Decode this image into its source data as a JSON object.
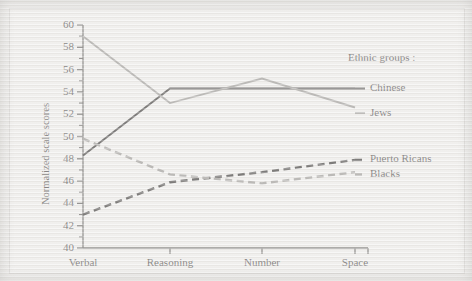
{
  "chart_data": {
    "type": "line",
    "title": "",
    "xlabel": "",
    "ylabel": "Normalized scale scores",
    "categories": [
      "Verbal",
      "Reasoning",
      "Number",
      "Space"
    ],
    "ylim": [
      40,
      60
    ],
    "yticks": [
      40,
      42,
      44,
      46,
      48,
      50,
      52,
      54,
      56,
      58,
      60
    ],
    "ytick_labels": [
      "40",
      "42",
      "44",
      "46",
      "48",
      "50",
      "52",
      "54",
      "56",
      "58",
      "60"
    ],
    "minor_tick_step": 1,
    "grid": false,
    "legend_title": "Ethnic groups :",
    "legend_position": "right",
    "series": [
      {
        "name": "Chinese",
        "values": [
          48.3,
          54.3,
          54.3,
          54.3
        ],
        "color": "#1d1b1a",
        "style": "solid",
        "label_y": 54.3
      },
      {
        "name": "Jews",
        "values": [
          59.0,
          53.0,
          55.2,
          52.6
        ],
        "color": "#8d8b88",
        "style": "solid",
        "label_y": 52.1
      },
      {
        "name": "Puerto Ricans",
        "values": [
          43.0,
          45.9,
          46.8,
          47.9
        ],
        "color": "#1d1b1a",
        "style": "dashed",
        "label_y": 47.9
      },
      {
        "name": "Blacks",
        "values": [
          49.8,
          46.6,
          45.8,
          46.8
        ],
        "color": "#8d8b88",
        "style": "dashed",
        "label_y": 46.6
      }
    ]
  },
  "colors": {
    "paper": "#e9e8e6",
    "panel": "#eeedeb",
    "axis": "#4a4846",
    "ink_dark": "#1d1b1a",
    "ink_gray": "#8d8b88",
    "text": "#2e2c2b",
    "border": "#cfcdca"
  }
}
